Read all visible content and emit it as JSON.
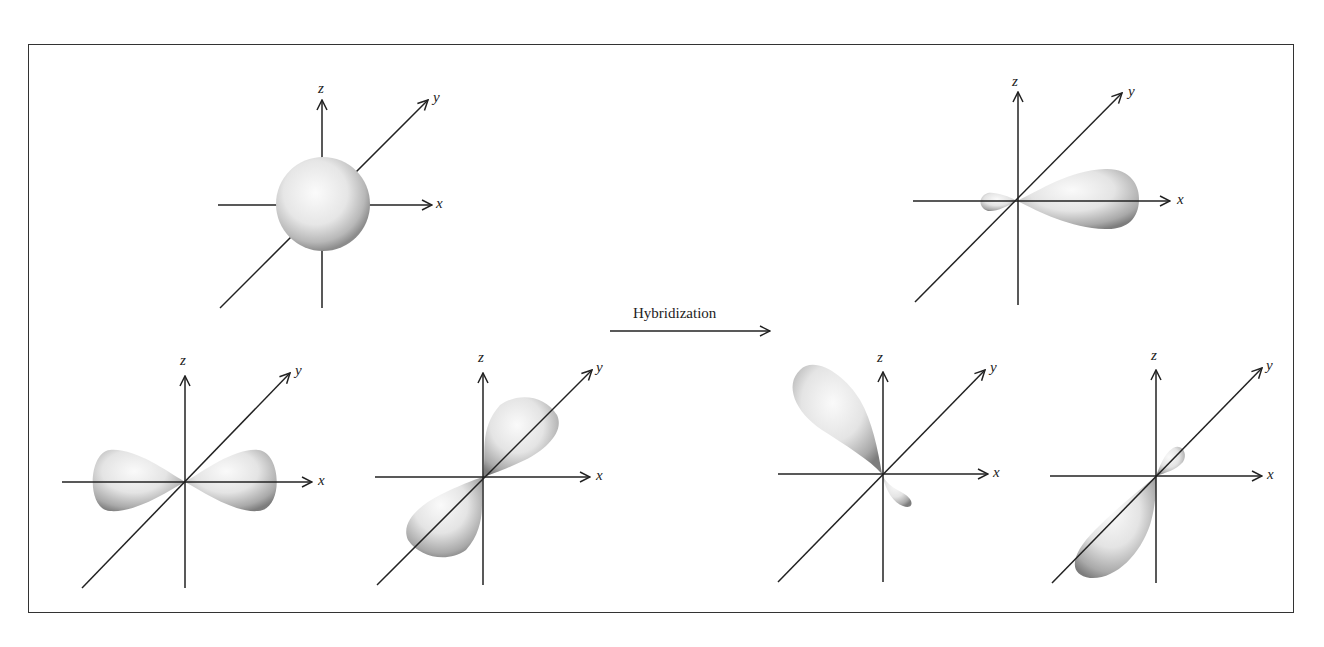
{
  "figure": {
    "arrow_label": "Hybridization",
    "before": {
      "s_orbital": {
        "label": "s orbital",
        "axes": {
          "x": "x",
          "y": "y",
          "z": "z"
        }
      },
      "px_orbital": {
        "label": "p orbital along x",
        "axes": {
          "x": "x",
          "y": "y",
          "z": "z"
        }
      },
      "py_orbital": {
        "label": "p orbital along y",
        "axes": {
          "x": "x",
          "y": "y",
          "z": "z"
        }
      }
    },
    "after": {
      "hybrid_1": {
        "label": "sp2 hybrid along +x",
        "axes": {
          "x": "x",
          "y": "y",
          "z": "z"
        }
      },
      "hybrid_2": {
        "label": "sp2 hybrid upper-left",
        "axes": {
          "x": "x",
          "y": "y",
          "z": "z"
        }
      },
      "hybrid_3": {
        "label": "sp2 hybrid along -y",
        "axes": {
          "x": "x",
          "y": "y",
          "z": "z"
        }
      }
    },
    "colors": {
      "lobe_light": "#f4f4f4",
      "lobe_dark": "#8a8a8a",
      "axis": "#222222",
      "border": "#333333"
    }
  }
}
